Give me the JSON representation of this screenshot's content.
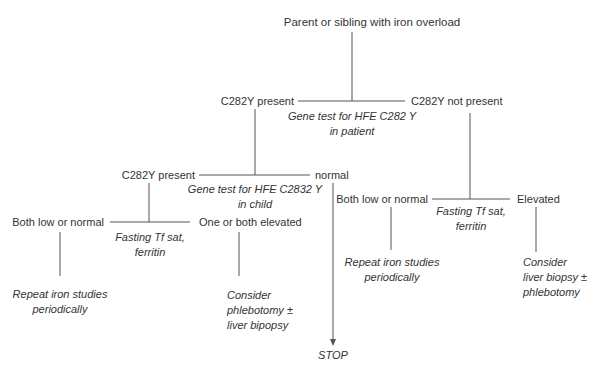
{
  "diagram": {
    "type": "decision-flowchart",
    "root": {
      "label": "Parent or sibling with iron overload"
    },
    "patient_test": {
      "label_line1": "Gene test for HFE C282 Y",
      "label_line2": "in patient",
      "present": "C282Y present",
      "not_present": "C282Y not present"
    },
    "child_test": {
      "label_line1": "Gene test for HFE C2832 Y",
      "label_line2": "in child",
      "present": "C282Y present",
      "normal": "normal"
    },
    "child_iron": {
      "label_line1": "Fasting Tf sat,",
      "label_line2": "ferritin",
      "low": "Both low or normal",
      "elevated": "One or both elevated",
      "low_action_line1": "Repeat iron studies",
      "low_action_line2": "periodically",
      "elevated_action_line1": "Consider",
      "elevated_action_line2": "phlebotomy ±",
      "elevated_action_line3": "liver bipopsy"
    },
    "patient_iron": {
      "label_line1": "Fasting Tf sat,",
      "label_line2": "ferritin",
      "low": "Both low or normal",
      "elevated": "Elevated",
      "low_action_line1": "Repeat iron studies",
      "low_action_line2": "periodically",
      "elevated_action_line1": "Consider",
      "elevated_action_line2": "liver biopsy ±",
      "elevated_action_line3": "phlebotomy"
    },
    "stop": "STOP",
    "colors": {
      "line": "#555555",
      "text": "#333333",
      "background": "#ffffff"
    }
  }
}
